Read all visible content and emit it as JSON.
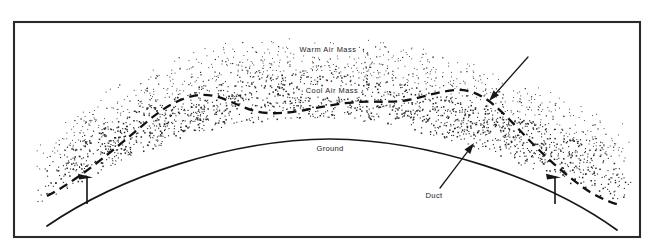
{
  "figure": {
    "kind": "diagram",
    "background_color": "#ffffff",
    "ink_color": "#17171a",
    "frame": {
      "x": 14,
      "y": 22,
      "width": 626,
      "height": 215,
      "stroke_color": "#2b2b2f"
    }
  },
  "labels": {
    "warm_air_mass": "Warm Air Mass",
    "cool_air_mass": "Cool Air Mass",
    "ground": "Ground",
    "duct": "Duct"
  },
  "label_positions": {
    "warm_air_mass": {
      "x": 328,
      "y": 50
    },
    "cool_air_mass": {
      "x": 332,
      "y": 91
    },
    "ground": {
      "x": 330,
      "y": 149
    },
    "duct": {
      "x": 434,
      "y": 196
    }
  },
  "annotations": [
    {
      "name": "inversion-pointer",
      "from": {
        "x": 528,
        "y": 57
      },
      "to": {
        "x": 489,
        "y": 101
      },
      "description": "arrow pointing down-left to the cool air mass upper boundary"
    },
    {
      "name": "duct-pointer",
      "from": {
        "x": 440,
        "y": 188
      },
      "to": {
        "x": 474,
        "y": 143
      },
      "description": "arrow from the Duct label pointing up-right into the duct layer"
    }
  ],
  "dimension_markers": [
    {
      "name": "duct-thickness-left",
      "x": 87,
      "y_top": 176,
      "y_bottom": 204
    },
    {
      "name": "duct-thickness-right",
      "x": 555,
      "y_top": 176,
      "y_bottom": 204
    }
  ],
  "geometry": {
    "ground_curve": "M 47 226 C 120 176, 230 140, 330 139 C 430 140, 545 178, 617 230",
    "boundary_dashed": "M 47 196 C 72 183, 96 164, 118 146 C 138 130, 155 113, 172 104 C 188 96, 200 93, 214 96 C 228 99, 240 107, 255 111 C 270 115, 288 113, 305 110 C 322 107, 340 103, 358 102 C 376 101, 392 103, 408 100 C 424 97, 440 91, 455 90 C 470 89, 482 95, 494 105 C 508 117, 520 131, 534 145 C 550 161, 570 179, 590 192 C 602 199, 612 203, 620 205",
    "stipple_band_upper": "M 36 146 C 64 122, 96 96, 130 76 C 170 53, 220 40, 275 36 C 330 32, 385 38, 438 52 C 490 66, 545 88, 600 112 C 614 118, 626 124, 636 129",
    "stipple_band_lower": "M 33 205 C 60 192, 90 176, 120 162 C 160 143, 205 128, 252 122 C 300 116, 350 118, 400 128 C 450 138, 505 158, 560 180 C 590 192, 615 201, 636 208"
  },
  "colors": {
    "stipple": "#26262b",
    "line": "#17171a",
    "frame": "#2b2b2f",
    "paper": "#ffffff"
  },
  "chart_data": {
    "type": "diagram",
    "regions": [
      {
        "name": "Warm Air Mass",
        "fill": "sparse-stipple",
        "position": "above the dashed inversion boundary"
      },
      {
        "name": "Cool Air Mass",
        "fill": "dense-stipple",
        "position": "between the dashed boundary and the ground curve"
      },
      {
        "name": "Ground",
        "fill": "none",
        "position": "curved earth surface below the duct"
      }
    ],
    "annotations": [
      "Duct"
    ]
  }
}
